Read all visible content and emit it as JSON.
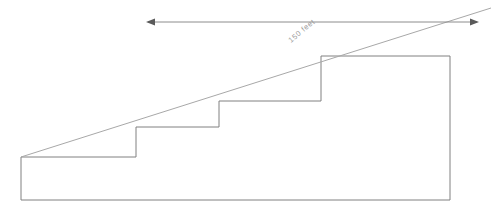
{
  "figure": {
    "background_color": "#ffffff",
    "outline_color": "#808080",
    "slope_color": "#a8a8a8",
    "dimension_color": "#8c8c8c",
    "label_color": "#9a9a9a"
  },
  "dimension": {
    "label": "150 feet",
    "value": 150,
    "unit": "feet",
    "rotation_degrees": -40,
    "left_arrow_icon": "arrow-left-icon",
    "right_arrow_icon": "arrow-right-icon",
    "line_y": 22,
    "left_arrow_x": 148,
    "right_arrow_x": 477
  },
  "geometry": {
    "base": {
      "left_x": 21,
      "right_x": 450,
      "bottom_y": 200,
      "first_tread_y": 157
    },
    "steps": [
      {
        "name": "step-1",
        "riser_x": 136,
        "tread_y": 127
      },
      {
        "name": "step-2",
        "riser_x": 219,
        "tread_y": 101
      },
      {
        "name": "step-3",
        "riser_x": 321,
        "tread_y": 56
      }
    ],
    "top_edge_y": 56,
    "slope_start": {
      "x": 21,
      "y": 157
    },
    "slope_end": {
      "x": 491,
      "y": 8
    }
  },
  "paths": {
    "outline": "M 21 200 L 21 157 L 136 157 L 136 127 L 219 127 L 219 101 L 321 101 L 321 56 L 450 56 L 450 200 Z",
    "slope": "M 21 157 L 491 8",
    "dimension": "M 148 22 L 477 22"
  }
}
